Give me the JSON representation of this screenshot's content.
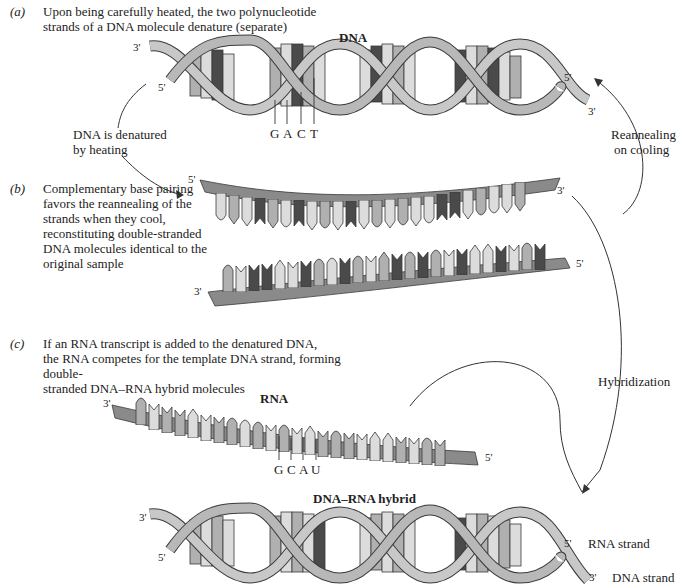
{
  "panels": {
    "a": {
      "tag": "(a)",
      "caption_lines": [
        "Upon being carefully heated, the two polynucleotide",
        "strands of a DNA molecule denature (separate)"
      ],
      "molecule_label": "DNA",
      "left_top_end": "3'",
      "left_bottom_end": "5'",
      "right_top_end": "5'",
      "right_bottom_end": "3'",
      "bases": [
        "G",
        "A",
        "C",
        "T"
      ]
    },
    "b": {
      "tag": "(b)",
      "caption_lines": [
        "Complementary base pairing",
        "favors the reannealing of the",
        "strands when they cool,",
        "reconstituting double-stranded",
        "DNA molecules identical to the",
        "original sample"
      ],
      "top_strand_left": "5'",
      "top_strand_right": "3'",
      "bottom_strand_left": "3'",
      "bottom_strand_right": "5'"
    },
    "c": {
      "tag": "(c)",
      "caption_lines": [
        "If an RNA transcript is added to the denatured DNA,",
        "the RNA competes for the template DNA strand, forming double-",
        "stranded DNA–RNA hybrid molecules"
      ],
      "rna_label": "RNA",
      "rna_left_end": "3'",
      "rna_right_end": "5'",
      "bases": [
        "G",
        "C",
        "A",
        "U"
      ],
      "hybrid_label": "DNA–RNA hybrid",
      "hybrid_left_top_end": "3'",
      "hybrid_left_bottom_end": "5'",
      "hybrid_right_top_end": "5'",
      "hybrid_right_bottom_end": "3'",
      "rna_strand_label": "RNA strand",
      "dna_strand_label": "DNA strand"
    }
  },
  "arrows": {
    "denature": [
      "DNA is denatured",
      "by heating"
    ],
    "reanneal": [
      "Reannealing",
      "on cooling"
    ],
    "hybridization": "Hybridization"
  },
  "colors": {
    "backbone_light": "#c8c8c8",
    "backbone_dark": "#8a8a8a",
    "base_light": "#dcdcdc",
    "base_mid": "#b0b0b0",
    "base_dark": "#4a4a4a",
    "outline": "#3a3a3a"
  }
}
